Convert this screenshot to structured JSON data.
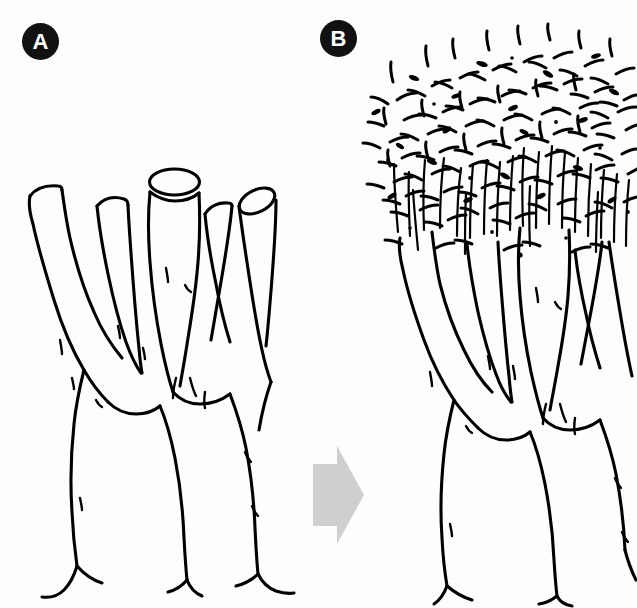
{
  "figure": {
    "kind": "line-drawing-diagram",
    "background_color": "#fdfdfd",
    "ink_color": "#000000",
    "width": 637,
    "height": 608
  },
  "panels": [
    {
      "id": "panel-a",
      "label": "A",
      "label_shape": "filled-circle",
      "label_text_color": "#ffffff",
      "label_bg_color": "#111111",
      "caption": "",
      "description": "Heavily pruned deciduous tree: a forked trunk rising from flared surface roots, splitting into five thick leafless limbs each ending in a blunt sawn stub with a visible elliptical cut face.",
      "state": "pruned",
      "foliage": "none",
      "cut_stub_count": 5,
      "trunk_legs": 2
    },
    {
      "id": "panel-b",
      "label": "B",
      "label_shape": "filled-circle",
      "label_text_color": "#ffffff",
      "label_bg_color": "#111111",
      "caption": "",
      "description": "The same pruned tree after a season of regrowth: identical forked trunk and stubs, now crowned with a dense mass of slender vertical water sprouts bearing many small leaves.",
      "state": "regrown",
      "foliage": "dense-sprouts",
      "cut_stub_count": 5,
      "trunk_legs": 2
    }
  ],
  "arrow": {
    "name": "progression-arrow",
    "direction": "right",
    "fill_color": "#cfcfcf",
    "meaning": "leads to / after regrowth",
    "label": ""
  },
  "colors": {
    "ink": "#000000",
    "paper": "#fdfdfd",
    "arrow_gray": "#cfcfcf",
    "label_black": "#111111",
    "label_white": "#ffffff"
  }
}
